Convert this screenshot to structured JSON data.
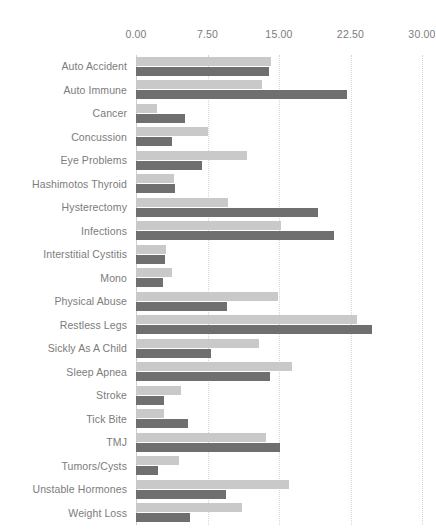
{
  "chart_data": {
    "type": "bar",
    "orientation": "horizontal",
    "title": "",
    "subtitle": "",
    "xlabel": "",
    "ylabel": "",
    "xlim": [
      0,
      30
    ],
    "ylim": null,
    "grid": true,
    "grid_axis": "x",
    "legend": false,
    "legend_position": "none",
    "xticks": [
      0.0,
      7.5,
      15.0,
      22.5,
      30.0
    ],
    "xtick_labels": [
      "0.00",
      "7.50",
      "15.00",
      "22.50",
      "30.00"
    ],
    "categories": [
      "Auto Accident",
      "Auto Immune",
      "Cancer",
      "Concussion",
      "Eye Problems",
      "Hashimotos Thyroid",
      "Hysterectomy",
      "Infections",
      "Interstitial Cystitis",
      "Mono",
      "Physical Abuse",
      "Restless Legs",
      "Sickly As A Child",
      "Sleep Apnea",
      "Stroke",
      "Tick Bite",
      "TMJ",
      "Tumors/Cysts",
      "Unstable Hormones",
      "Weight Loss"
    ],
    "series": [
      {
        "name": "Series 1",
        "color": "#c9c9c9",
        "values": [
          14.2,
          13.2,
          2.2,
          7.6,
          11.6,
          4.0,
          9.6,
          15.2,
          3.1,
          3.8,
          14.9,
          23.2,
          12.9,
          16.4,
          4.7,
          2.9,
          13.6,
          4.5,
          16.0,
          11.1
        ]
      },
      {
        "name": "Series 2",
        "color": "#6f6f6f",
        "values": [
          14.0,
          22.1,
          5.1,
          3.8,
          6.9,
          4.1,
          19.1,
          20.8,
          3.0,
          2.8,
          9.5,
          24.8,
          7.9,
          14.1,
          2.9,
          5.5,
          15.1,
          2.3,
          9.4,
          5.7
        ]
      }
    ]
  }
}
